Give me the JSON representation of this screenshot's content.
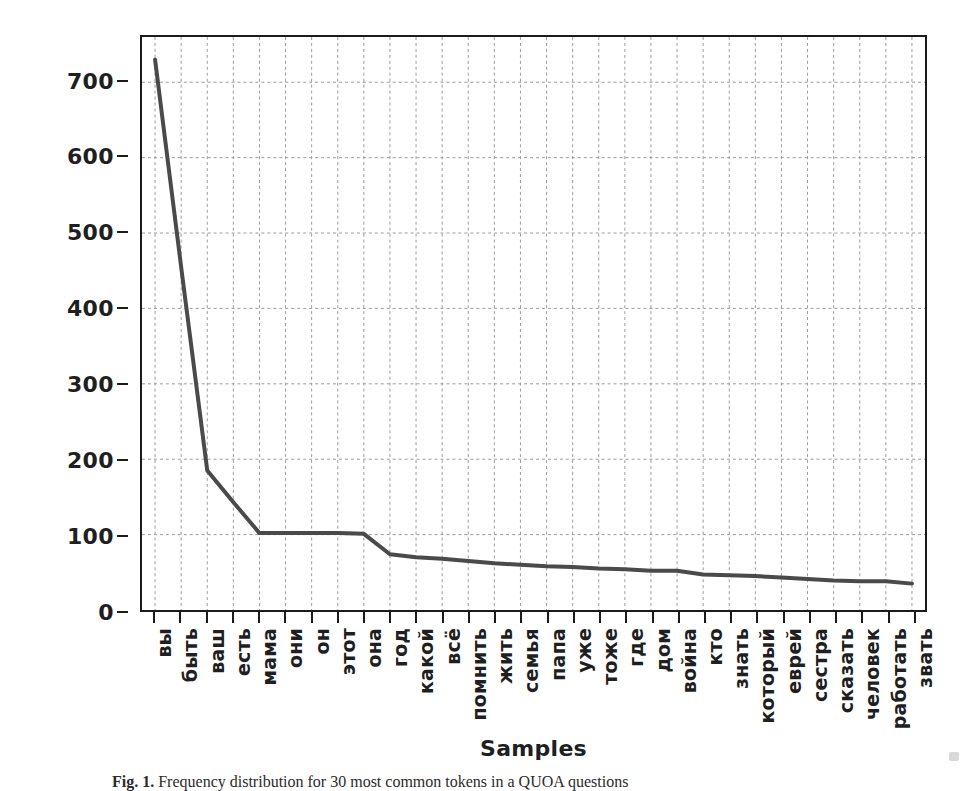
{
  "figure": {
    "caption_label": "Fig. 1.",
    "caption_text": "Frequency distribution for 30 most common tokens in a QUOA questions"
  },
  "chart_data": {
    "type": "line",
    "title": "",
    "xlabel": "Samples",
    "ylabel": "Counts",
    "ylim": [
      0,
      760
    ],
    "yticks": [
      0,
      100,
      200,
      300,
      400,
      500,
      600,
      700
    ],
    "grid": true,
    "legend": "none",
    "line_color": "#4a4a4a",
    "categories": [
      "вы",
      "быть",
      "ваш",
      "есть",
      "мама",
      "они",
      "он",
      "этот",
      "она",
      "год",
      "какой",
      "всё",
      "помнить",
      "жить",
      "семья",
      "папа",
      "уже",
      "тоже",
      "где",
      "дом",
      "война",
      "кто",
      "знать",
      "который",
      "еврей",
      "сестра",
      "сказать",
      "человек",
      "работать",
      "звать"
    ],
    "values": [
      730,
      455,
      185,
      143,
      102,
      102,
      102,
      102,
      101,
      74,
      70,
      68,
      65,
      62,
      60,
      58,
      57,
      55,
      54,
      52,
      52,
      47,
      46,
      45,
      43,
      41,
      39,
      38,
      38,
      35
    ]
  }
}
